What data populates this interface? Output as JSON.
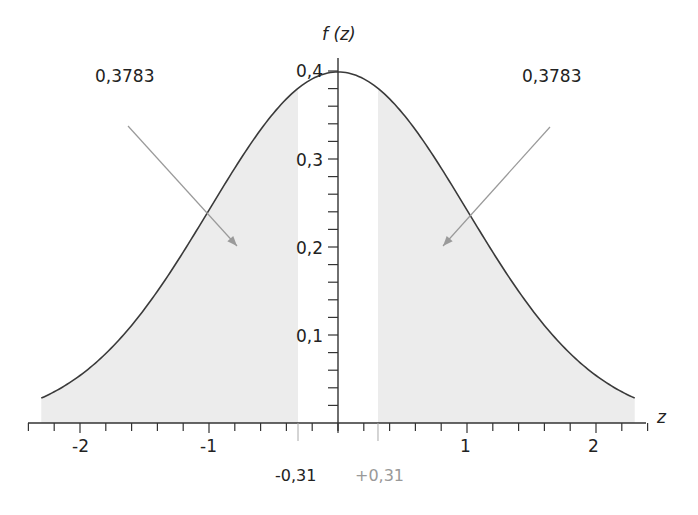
{
  "chart_data": {
    "type": "area",
    "title": "",
    "xlabel": "z",
    "ylabel": "f (z)",
    "function": "standard normal density",
    "xlim": [
      -2.3,
      2.3
    ],
    "ylim": [
      0,
      0.4
    ],
    "x_ticks": [
      -2,
      -1,
      1,
      2
    ],
    "x_tick_labels": [
      "-2",
      "-1",
      "1",
      "2"
    ],
    "x_minor_step": 0.2,
    "y_ticks": [
      0.1,
      0.2,
      0.3,
      0.4
    ],
    "y_tick_labels": [
      "0,1",
      "0,2",
      "0,3",
      "0,4"
    ],
    "y_minor_step": 0.02,
    "grid": false,
    "shaded_regions": [
      {
        "from": -2.3,
        "to": -0.31,
        "area_label": "0,3783"
      },
      {
        "from": 0.31,
        "to": 2.3,
        "area_label": "0,3783"
      }
    ],
    "markers": [
      {
        "x": -0.31,
        "label": "-0,31",
        "color": "#222222"
      },
      {
        "x": 0.31,
        "label": "+0,31",
        "color": "#999999"
      }
    ],
    "annotations": [
      {
        "text": "0,3783",
        "side": "left"
      },
      {
        "text": "0,3783",
        "side": "right"
      }
    ]
  },
  "colors": {
    "curve": "#3a3a3a",
    "fill": "#ececec",
    "axis": "#333333",
    "arrow": "#9a9a9a",
    "marker_pos": "#999999"
  }
}
